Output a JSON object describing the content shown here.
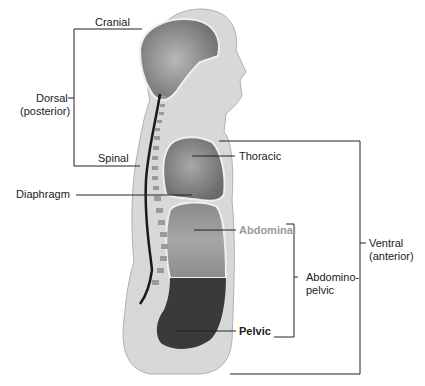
{
  "labels": {
    "cranial": "Cranial",
    "dorsal_1": "Dorsal",
    "dorsal_2": "(posterior)",
    "spinal": "Spinal",
    "diaphragm": "Diaphragm",
    "thoracic": "Thoracic",
    "abdominal": "Abdominal",
    "pelvic": "Pelvic",
    "abdominopelvic_1": "Abdomino-",
    "abdominopelvic_2": "pelvic",
    "ventral_1": "Ventral",
    "ventral_2": "(anterior)"
  },
  "colors": {
    "body": "#d6d6d6",
    "body_outline": "#b5b5b5",
    "cavity_light": "#8f8f8f",
    "cavity_mid": "#7a7a7a",
    "pelvic": "#3a3a3a",
    "spinal_cord": "#1a1a1a",
    "line": "#222222",
    "abdominal_label": "#9a9a9a"
  }
}
